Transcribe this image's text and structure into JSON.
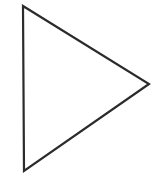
{
  "diagram": {
    "shape": "triangle",
    "orientation": "right-pointing",
    "stroke_color": "#2b2b2b",
    "fill_color": "#ffffff",
    "stroke_width": 2.2,
    "vertices": [
      [
        23,
        6
      ],
      [
        149,
        84
      ],
      [
        24,
        171
      ]
    ]
  }
}
